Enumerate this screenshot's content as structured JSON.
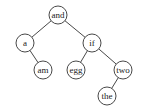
{
  "diagram": {
    "type": "binary-search-tree",
    "stroke_color": "#333333",
    "fill_color": "#ffffff",
    "nodes": [
      {
        "id": "and",
        "label": "and",
        "x": 58,
        "y": 15,
        "r": 9
      },
      {
        "id": "a",
        "label": "a",
        "x": 25,
        "y": 43,
        "r": 9
      },
      {
        "id": "am",
        "label": "am",
        "x": 43,
        "y": 70,
        "r": 9
      },
      {
        "id": "if",
        "label": "if",
        "x": 92,
        "y": 43,
        "r": 9
      },
      {
        "id": "egg",
        "label": "egg",
        "x": 76,
        "y": 70,
        "r": 9
      },
      {
        "id": "two",
        "label": "two",
        "x": 123,
        "y": 70,
        "r": 9
      },
      {
        "id": "the",
        "label": "the",
        "x": 107,
        "y": 96,
        "r": 9
      }
    ],
    "edges": [
      {
        "from": "and",
        "to": "a"
      },
      {
        "from": "and",
        "to": "if"
      },
      {
        "from": "a",
        "to": "am"
      },
      {
        "from": "if",
        "to": "egg"
      },
      {
        "from": "if",
        "to": "two"
      },
      {
        "from": "two",
        "to": "the"
      }
    ]
  }
}
